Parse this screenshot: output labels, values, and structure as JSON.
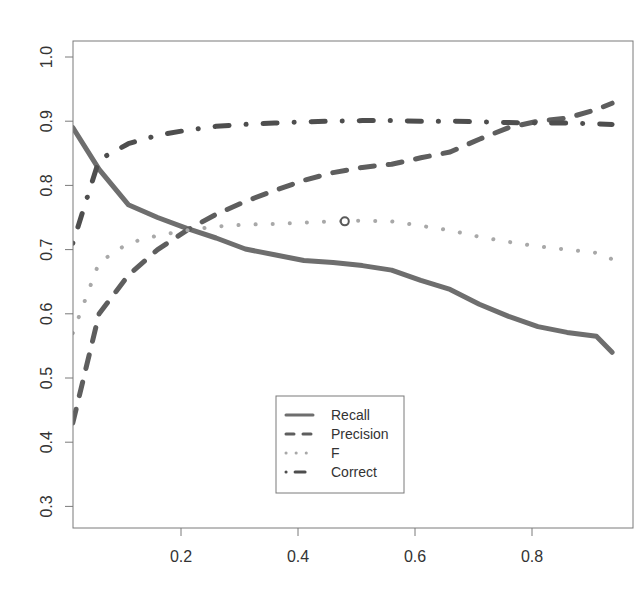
{
  "chart_data": {
    "type": "line",
    "title": "",
    "xlabel": "",
    "ylabel": "",
    "xlim": [
      0.015,
      0.937
    ],
    "ylim": [
      0.272,
      1.028
    ],
    "grid": false,
    "legend_position": "bottom-center",
    "x_ticks": [
      0.2,
      0.4,
      0.6,
      0.8
    ],
    "x_tick_labels": [
      "0.2",
      "0.4",
      "0.6",
      "0.8"
    ],
    "y_ticks": [
      0.3,
      0.4,
      0.5,
      0.6,
      0.7,
      0.8,
      0.9,
      1.0
    ],
    "y_tick_labels": [
      "0.3",
      "0.4",
      "0.5",
      "0.6",
      "0.7",
      "0.8",
      "0.9",
      "1.0"
    ],
    "x": [
      0.015,
      0.06,
      0.11,
      0.16,
      0.21,
      0.26,
      0.31,
      0.36,
      0.41,
      0.46,
      0.51,
      0.56,
      0.61,
      0.66,
      0.71,
      0.76,
      0.81,
      0.86,
      0.91,
      0.937
    ],
    "series": [
      {
        "name": "Recall",
        "style": "solid",
        "color": "#6e6e6e",
        "values": [
          0.89,
          0.825,
          0.77,
          0.75,
          0.733,
          0.718,
          0.701,
          0.692,
          0.683,
          0.68,
          0.675,
          0.668,
          0.652,
          0.638,
          0.615,
          0.596,
          0.58,
          0.571,
          0.565,
          0.54
        ]
      },
      {
        "name": "Precision",
        "style": "dashed",
        "color": "#5e5e5e",
        "values": [
          0.43,
          0.6,
          0.66,
          0.7,
          0.73,
          0.755,
          0.775,
          0.792,
          0.808,
          0.82,
          0.828,
          0.833,
          0.843,
          0.852,
          0.872,
          0.89,
          0.9,
          0.905,
          0.918,
          0.928
        ]
      },
      {
        "name": "F",
        "style": "dotted",
        "color": "#a8a8a8",
        "values": [
          0.57,
          0.68,
          0.71,
          0.722,
          0.73,
          0.736,
          0.739,
          0.74,
          0.742,
          0.744,
          0.745,
          0.744,
          0.737,
          0.73,
          0.72,
          0.712,
          0.705,
          0.7,
          0.695,
          0.685
        ]
      },
      {
        "name": "Correct",
        "style": "dotdash",
        "color": "#4e4e4e",
        "values": [
          0.71,
          0.84,
          0.865,
          0.878,
          0.886,
          0.892,
          0.895,
          0.897,
          0.899,
          0.9,
          0.901,
          0.901,
          0.9,
          0.9,
          0.899,
          0.898,
          0.897,
          0.897,
          0.896,
          0.895
        ]
      }
    ],
    "annotations": [
      {
        "type": "open-circle-marker",
        "series": "F",
        "x": 0.48,
        "y": 0.744
      }
    ]
  }
}
